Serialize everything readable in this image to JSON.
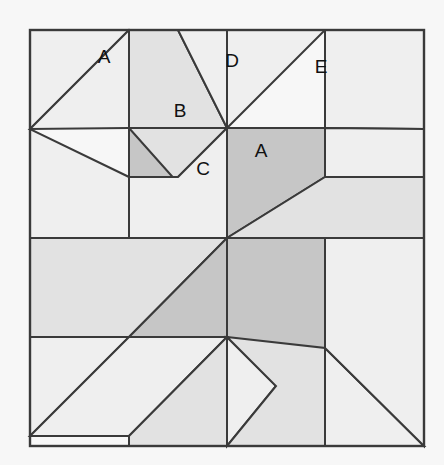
{
  "diagram": {
    "type": "quilt-block-piecing-diagram",
    "canvas": {
      "width": 444,
      "height": 465,
      "background": "#f7f7f7"
    },
    "block": {
      "left": 30,
      "top": 30,
      "right": 424,
      "bottom": 446,
      "width": 394,
      "height": 416,
      "center_x": 227,
      "center_y": 238,
      "grid": "4x4",
      "symmetry": "180-degree rotational (pinwheel)"
    },
    "colors": {
      "background": "#f7f7f7",
      "light": "#efefef",
      "medium": "#e2e2e2",
      "dark": "#c6c6c6",
      "outline": "#3a3a3a",
      "label_text": "#111111"
    },
    "labels": [
      {
        "id": "label-a-top-left",
        "text": "A",
        "x": 104,
        "y": 58,
        "patch": "light-corner-triangle"
      },
      {
        "id": "label-d-top",
        "text": "D",
        "x": 232,
        "y": 62,
        "patch": "light-top-triangle"
      },
      {
        "id": "label-e-top-right",
        "text": "E",
        "x": 321,
        "y": 68,
        "patch": "light-corner-triangle"
      },
      {
        "id": "label-b-upper",
        "text": "B",
        "x": 180,
        "y": 112,
        "patch": "medium-triangle"
      },
      {
        "id": "label-c-middle",
        "text": "C",
        "x": 203,
        "y": 170,
        "patch": "light-triangle"
      },
      {
        "id": "label-a-center",
        "text": "A",
        "x": 261,
        "y": 152,
        "patch": "dark-star-blade"
      }
    ],
    "patches": [
      {
        "id": "p01",
        "name": "upper-left-light-wedge",
        "shade": "light",
        "points": "30,30 129,30 30,129"
      },
      {
        "id": "p02",
        "name": "upper-left-light-band",
        "shade": "light",
        "points": "30,129 129,30 227,128 129,128"
      },
      {
        "id": "p03",
        "name": "upper-mid-medium-wedge",
        "shade": "medium",
        "points": "129,30 178,30 227,128 129,128"
      },
      {
        "id": "p04",
        "name": "upper-mid-medium-vane",
        "shade": "medium",
        "points": "129,128 227,128 178,177 129,177"
      },
      {
        "id": "p05",
        "name": "top-light-triangle-d",
        "shade": "light",
        "points": "178,30 227,30 227,128"
      },
      {
        "id": "p06",
        "name": "top-right-light-band",
        "shade": "light",
        "points": "227,30 325,30 227,128"
      },
      {
        "id": "p07",
        "name": "top-right-light-wedge",
        "shade": "light",
        "points": "325,30 424,30 424,129 325,128"
      },
      {
        "id": "p08",
        "name": "center-dark-blade-top",
        "shade": "dark",
        "points": "227,128 325,128 325,177 227,238"
      },
      {
        "id": "p09",
        "name": "center-dark-blade-left",
        "shade": "dark",
        "points": "129,128 227,238 129,238"
      },
      {
        "id": "p10",
        "name": "center-light-c-triangle",
        "shade": "light",
        "points": "178,177 227,128 227,238 129,238 129,177"
      },
      {
        "id": "p11",
        "name": "right-medium-vane",
        "shade": "medium",
        "points": "325,177 424,177 424,238 325,238 227,238"
      },
      {
        "id": "p12",
        "name": "right-light-wedge",
        "shade": "light",
        "points": "424,129 424,177 325,177 325,128"
      },
      {
        "id": "p13",
        "name": "left-light-wedge",
        "shade": "light",
        "points": "30,129 30,238 129,238 129,177"
      },
      {
        "id": "p14",
        "name": "left-medium-vane",
        "shade": "medium",
        "points": "30,238 129,238 227,238 129,337 30,337"
      },
      {
        "id": "p15",
        "name": "lower-left-light-wedge",
        "shade": "light",
        "points": "30,337 129,337 30,436"
      },
      {
        "id": "p16",
        "name": "center-dark-blade-bottom",
        "shade": "dark",
        "points": "129,337 227,238 227,337 129,337"
      },
      {
        "id": "p17",
        "name": "center-dark-blade-right",
        "shade": "dark",
        "points": "227,238 325,238 325,348 227,348"
      },
      {
        "id": "p18",
        "name": "bottom-light-band",
        "shade": "light",
        "points": "30,436 129,337 227,337 129,436"
      },
      {
        "id": "p19",
        "name": "bottom-medium-vane",
        "shade": "medium",
        "points": "129,436 227,337 227,446 129,446"
      },
      {
        "id": "p20",
        "name": "bottom-light-triangle",
        "shade": "light",
        "points": "227,337 276,386 227,446"
      },
      {
        "id": "p21",
        "name": "bottom-medium-wedge",
        "shade": "medium",
        "points": "227,337 325,348 325,446 227,446 276,386"
      },
      {
        "id": "p22",
        "name": "bottom-right-light-band",
        "shade": "light",
        "points": "325,348 424,446 325,446"
      },
      {
        "id": "p23",
        "name": "bottom-right-light-wedge",
        "shade": "light",
        "points": "424,238 424,446 325,348 325,238"
      }
    ]
  }
}
